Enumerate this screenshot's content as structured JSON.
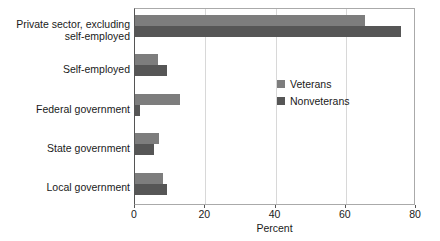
{
  "chart_data": {
    "type": "bar",
    "orientation": "horizontal",
    "title": "",
    "xlabel": "Percent",
    "ylabel": "",
    "xlim": [
      0,
      80
    ],
    "xticks": [
      0,
      20,
      40,
      60,
      80
    ],
    "xtick_labels": [
      "0",
      "20",
      "40",
      "60",
      "80"
    ],
    "grid": true,
    "grid_axis": "x",
    "legend_position": "inside-right",
    "categories": [
      "Private sector, excluding self-employed",
      "Self-employed",
      "Federal government",
      "State government",
      "Local government"
    ],
    "category_lines": [
      [
        "Private sector, excluding",
        "self-employed"
      ],
      [
        "Self-employed"
      ],
      [
        "Federal government"
      ],
      [
        "State government"
      ],
      [
        "Local government"
      ]
    ],
    "series": [
      {
        "name": "Veterans",
        "color": "#7d7d7d",
        "values": [
          65.4,
          6.5,
          12.8,
          6.8,
          8.0
        ]
      },
      {
        "name": "Nonveterans",
        "color": "#565656",
        "values": [
          75.7,
          9.1,
          1.4,
          5.4,
          9.1
        ]
      }
    ]
  },
  "colors": {
    "veterans": "#7d7d7d",
    "nonveterans": "#565656",
    "gridline": "#d8d8d8",
    "axis": "#555555",
    "frame": "#aaaaaa",
    "text": "#1a1a1a",
    "background": "#ffffff"
  }
}
